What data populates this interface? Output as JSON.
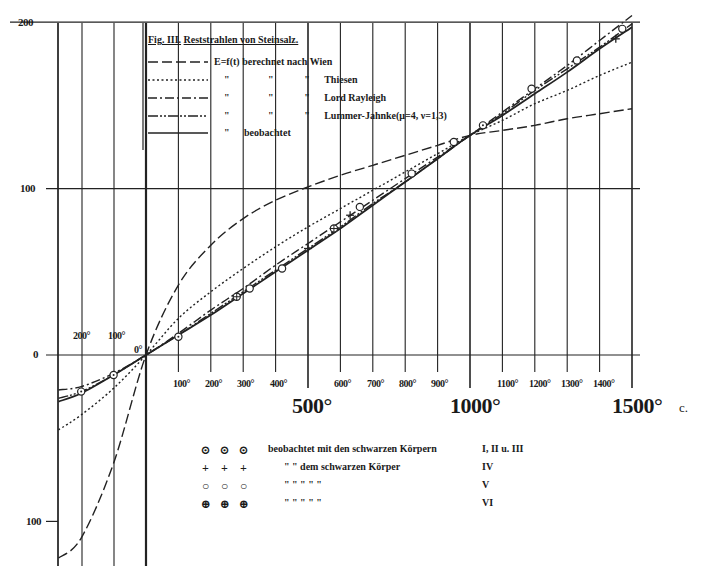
{
  "chart_data": {
    "type": "line",
    "title": "Fig. III. Reststrahlen von Steinsalz.",
    "xlabel": "Temperatur (°C)",
    "ylabel": "E",
    "x_unit": "c.",
    "xlim": [
      -270,
      1500
    ],
    "ylim": [
      -125,
      200
    ],
    "grid": true,
    "y_ticks": [
      "200",
      "100",
      "0",
      "100"
    ],
    "x_ticks_small_left": [
      "200°",
      "100°",
      "0°"
    ],
    "x_ticks_small_right": [
      "100°",
      "200°",
      "300°",
      "400°",
      "600°",
      "700°",
      "800°",
      "900°",
      "1100°",
      "1200°",
      "1300°",
      "1400°"
    ],
    "x_ticks_big": [
      "500°",
      "1000°",
      "1500°"
    ],
    "x": [
      -270,
      -200,
      -100,
      0,
      100,
      200,
      300,
      400,
      500,
      600,
      700,
      800,
      900,
      1000,
      1100,
      1200,
      1300,
      1400,
      1500
    ],
    "series": [
      {
        "name": "E=f(t) berechnet nach Wien",
        "style": "dashed",
        "values": [
          -122,
          -110,
          -65,
          0,
          42,
          66,
          82,
          93,
          101,
          108,
          114,
          120,
          126,
          132,
          135,
          138,
          142,
          145,
          148
        ]
      },
      {
        "name": "berechnet nach Thiesen",
        "style": "dotted",
        "values": [
          -45,
          -36,
          -20,
          0,
          22,
          38,
          52,
          65,
          77,
          88,
          99,
          110,
          121,
          132,
          141,
          151,
          159,
          168,
          176
        ]
      },
      {
        "name": "berechnet nach Lord Rayleigh",
        "style": "dash-dot",
        "values": [
          -21,
          -19,
          -11,
          0,
          13,
          27,
          40,
          54,
          67,
          80,
          93,
          106,
          119,
          132,
          146,
          160,
          174,
          189,
          204
        ]
      },
      {
        "name": "berechnet nach Lummer-Jahnke (μ=4, ν=1,3)",
        "style": "dash-double-dot",
        "values": [
          -26,
          -22,
          -12,
          0,
          12,
          25,
          38,
          51,
          64,
          77,
          91,
          104,
          118,
          132,
          145,
          159,
          172,
          185,
          199
        ]
      },
      {
        "name": "beobachtet",
        "style": "solid",
        "values": [
          -28,
          -23,
          -12,
          0,
          12,
          24,
          37,
          50,
          63,
          76,
          90,
          104,
          118,
          132,
          144,
          157,
          170,
          184,
          197
        ]
      }
    ],
    "observed_points": [
      {
        "x": -200,
        "y": -22,
        "marker": "circle-dot"
      },
      {
        "x": -100,
        "y": -12,
        "marker": "circle-dot"
      },
      {
        "x": 100,
        "y": 11,
        "marker": "circle-dot"
      },
      {
        "x": 280,
        "y": 35,
        "marker": "crossed-circle"
      },
      {
        "x": 320,
        "y": 40,
        "marker": "circle"
      },
      {
        "x": 420,
        "y": 52,
        "marker": "circle"
      },
      {
        "x": 500,
        "y": 64,
        "marker": "cross"
      },
      {
        "x": 580,
        "y": 76,
        "marker": "crossed-circle"
      },
      {
        "x": 630,
        "y": 84,
        "marker": "cross"
      },
      {
        "x": 660,
        "y": 89,
        "marker": "circle"
      },
      {
        "x": 820,
        "y": 109,
        "marker": "circle"
      },
      {
        "x": 950,
        "y": 128,
        "marker": "circle"
      },
      {
        "x": 1040,
        "y": 138,
        "marker": "circle-dot"
      },
      {
        "x": 1190,
        "y": 160,
        "marker": "circle"
      },
      {
        "x": 1330,
        "y": 177,
        "marker": "circle"
      },
      {
        "x": 1450,
        "y": 190,
        "marker": "cross"
      },
      {
        "x": 1470,
        "y": 196,
        "marker": "circle"
      }
    ]
  },
  "title": {
    "fig": "Fig. III.",
    "text": "Reststrahlen von Steinsalz."
  },
  "legend": [
    {
      "style": "dashed",
      "c1": "E=f(t)",
      "c2": "berechnet",
      "c3": "nach",
      "name": "Wien"
    },
    {
      "style": "dotted",
      "c1": "\"",
      "c2": "\"",
      "c3": "\"",
      "name": "Thiesen"
    },
    {
      "style": "dash-dot",
      "c1": "\"",
      "c2": "\"",
      "c3": "\"",
      "name": "Lord Rayleigh"
    },
    {
      "style": "dash-double-dot",
      "c1": "\"",
      "c2": "\"",
      "c3": "\"",
      "name": "Lummer-Jahnke(μ=4, ν=1,3)"
    },
    {
      "style": "solid",
      "c1": "\"",
      "c2": "beobachtet",
      "c3": "",
      "name": ""
    }
  ],
  "marker_legend": [
    {
      "symbols": [
        "⊙",
        "⊙",
        "⊙"
      ],
      "text": "beobachtet  mit den  schwarzen  Körpern",
      "label": "I, II u. III"
    },
    {
      "symbols": [
        "+",
        "+",
        "+"
      ],
      "text": "\"          \"  dem schwarzen  Körper",
      "label": "IV"
    },
    {
      "symbols": [
        "○",
        "○",
        "○"
      ],
      "text": "\"          \"     \"         \"          \"",
      "label": "V"
    },
    {
      "symbols": [
        "⊕",
        "⊕",
        "⊕"
      ],
      "text": "\"          \"     \"         \"          \"",
      "label": "VI"
    }
  ],
  "axis": {
    "y_top": "200",
    "y_mid": "100",
    "y_zero": "0",
    "y_bottom": "100",
    "left_200": "200°",
    "left_100": "100°",
    "zero_deg": "0°",
    "small": [
      "100°",
      "200°",
      "300°",
      "400°",
      "600°",
      "700°",
      "800°",
      "900°",
      "1100°",
      "1200°",
      "1300°",
      "1400°"
    ],
    "big_500": "500°",
    "big_1000": "1000°",
    "big_1500": "1500°",
    "unit": "c."
  }
}
